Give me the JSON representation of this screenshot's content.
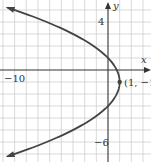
{
  "chart_data": {
    "type": "line",
    "title": "",
    "xlabel": "x",
    "ylabel": "y",
    "equation": "x = 1 - (y + 1)^2 / 4",
    "xlim": [
      -9,
      3.5
    ],
    "ylim": [
      -7.5,
      5.8
    ],
    "grid": true,
    "x_tick_labels": [
      {
        "value": -10,
        "text": "−10"
      }
    ],
    "y_tick_labels": [
      {
        "value": 4,
        "text": "4"
      },
      {
        "value": -6,
        "text": "−6"
      }
    ],
    "series": [
      {
        "name": "parabola",
        "color": "#444444",
        "points": [
          {
            "x": -8.6,
            "y": 5.2
          },
          {
            "x": -5.25,
            "y": 4.0
          },
          {
            "x": -3.0,
            "y": 3.0
          },
          {
            "x": -1.25,
            "y": 2.0
          },
          {
            "x": 0.0,
            "y": 1.0
          },
          {
            "x": 0.75,
            "y": 0.0
          },
          {
            "x": 1.0,
            "y": -1.0
          },
          {
            "x": 0.75,
            "y": -2.0
          },
          {
            "x": 0.0,
            "y": -3.0
          },
          {
            "x": -1.25,
            "y": -4.0
          },
          {
            "x": -3.0,
            "y": -5.0
          },
          {
            "x": -5.25,
            "y": -6.0
          },
          {
            "x": -8.0,
            "y": -7.0
          },
          {
            "x": -8.6,
            "y": -7.2
          }
        ],
        "arrows_at_ends": true
      }
    ],
    "annotations": [
      {
        "text": "(1, −1)",
        "x": 1,
        "y": -1,
        "marker": "dot"
      }
    ]
  },
  "labels": {
    "x_axis": "x",
    "y_axis": "y",
    "tick_neg10": "−10",
    "tick_4": "4",
    "tick_neg6": "−6",
    "vertex": "(1, −1)"
  },
  "colors": {
    "grid": "#cfcfcf",
    "axis": "#333333",
    "curve": "#444444"
  }
}
